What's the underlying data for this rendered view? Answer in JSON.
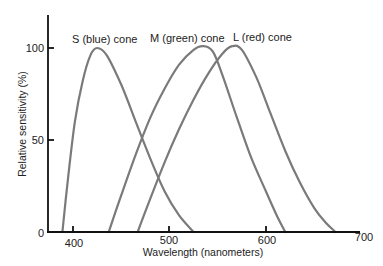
{
  "chart_data": {
    "type": "line",
    "title": "",
    "xlabel": "Wavelength (nanometers)",
    "ylabel": "Relative sensitivity (%)",
    "xlim": [
      385,
      700
    ],
    "ylim": [
      0,
      115
    ],
    "x_ticks": [
      400,
      500,
      600,
      700
    ],
    "y_ticks": [
      0,
      50,
      100
    ],
    "grid": false,
    "legend": "inline labels above curve peaks",
    "series": [
      {
        "name": "S (blue) cone",
        "color": "#7a7a7a",
        "points": [
          [
            389,
            0
          ],
          [
            395,
            30
          ],
          [
            402,
            60
          ],
          [
            410,
            82
          ],
          [
            418,
            96
          ],
          [
            425,
            100
          ],
          [
            435,
            96
          ],
          [
            450,
            80
          ],
          [
            465,
            60
          ],
          [
            480,
            40
          ],
          [
            495,
            22
          ],
          [
            510,
            9
          ],
          [
            525,
            0
          ]
        ]
      },
      {
        "name": "M (green) cone",
        "color": "#7a7a7a",
        "points": [
          [
            437,
            0
          ],
          [
            450,
            20
          ],
          [
            465,
            42
          ],
          [
            480,
            62
          ],
          [
            495,
            78
          ],
          [
            510,
            91
          ],
          [
            525,
            99
          ],
          [
            535,
            101
          ],
          [
            545,
            98
          ],
          [
            555,
            85
          ],
          [
            570,
            62
          ],
          [
            585,
            40
          ],
          [
            600,
            22
          ],
          [
            612,
            8
          ],
          [
            620,
            0
          ]
        ]
      },
      {
        "name": "L (red) cone",
        "color": "#7a7a7a",
        "points": [
          [
            467,
            0
          ],
          [
            480,
            18
          ],
          [
            495,
            38
          ],
          [
            510,
            56
          ],
          [
            525,
            72
          ],
          [
            540,
            86
          ],
          [
            555,
            97
          ],
          [
            565,
            101
          ],
          [
            575,
            99
          ],
          [
            590,
            84
          ],
          [
            605,
            64
          ],
          [
            620,
            44
          ],
          [
            635,
            27
          ],
          [
            650,
            13
          ],
          [
            662,
            5
          ],
          [
            672,
            0
          ]
        ]
      }
    ]
  },
  "labels": {
    "s_cone": "S (blue) cone",
    "m_cone": "M (green) cone",
    "l_cone": "L (red) cone",
    "xlabel": "Wavelength (nanometers)",
    "ylabel": "Relative sensitivity (%)",
    "x_ticks": [
      "400",
      "500",
      "600",
      "700"
    ],
    "y_ticks": [
      "0",
      "50",
      "100"
    ]
  }
}
